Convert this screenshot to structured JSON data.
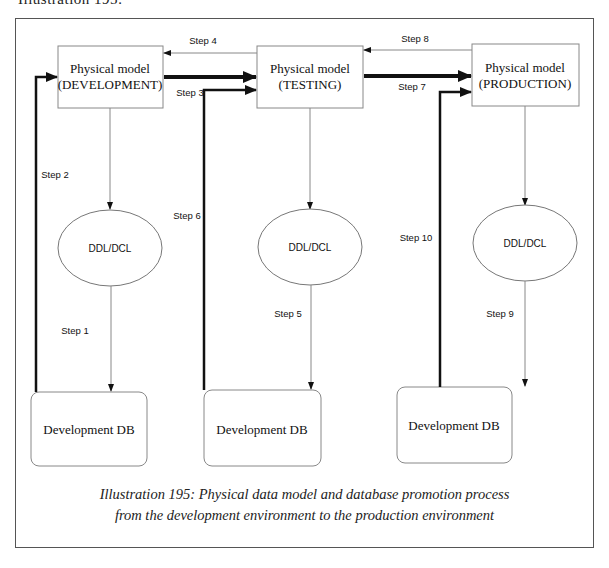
{
  "page": {
    "top_text": "Illustration 195:"
  },
  "nodes": {
    "model_dev": {
      "line1": "Physical model",
      "line2": "(DEVELOPMENT)"
    },
    "model_test": {
      "line1": "Physical model",
      "line2": "(TESTING)"
    },
    "model_prod": {
      "line1": "Physical model",
      "line2": "(PRODUCTION)"
    },
    "ddl_dev": {
      "label": "DDL/DCL"
    },
    "ddl_test": {
      "label": "DDL/DCL"
    },
    "ddl_prod": {
      "label": "DDL/DCL"
    },
    "db_dev": {
      "label": "Development DB"
    },
    "db_test": {
      "label": "Development DB"
    },
    "db_prod": {
      "label": "Development DB"
    }
  },
  "steps": {
    "step1": "Step 1",
    "step2": "Step 2",
    "step3": "Step 3",
    "step4": "Step 4",
    "step5": "Step 5",
    "step6": "Step 6",
    "step7": "Step 7",
    "step8": "Step 8",
    "step9": "Step 9",
    "step10": "Step 10"
  },
  "caption": {
    "line1": "Illustration 195:  Physical data model and database promotion process",
    "line2": "from the development environment to the production environment"
  },
  "colors": {
    "line": "#111111",
    "box_border": "#888888",
    "frame": "#555555"
  }
}
